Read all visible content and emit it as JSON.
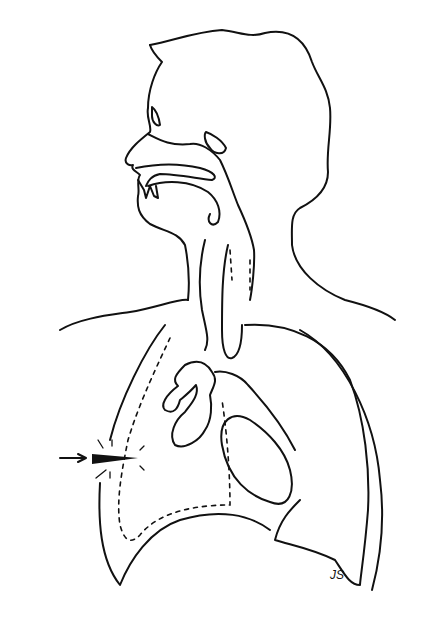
{
  "figure": {
    "signature": "JS",
    "colors": {
      "line": "#111111",
      "background": "#ffffff"
    },
    "elements": [
      "head-profile",
      "nasal-cavity",
      "oral-cavity",
      "trachea",
      "left-lung",
      "right-lung-collapsed",
      "heart",
      "pleural-boundary-dotted",
      "penetrating-object",
      "arrow-indicator"
    ]
  }
}
